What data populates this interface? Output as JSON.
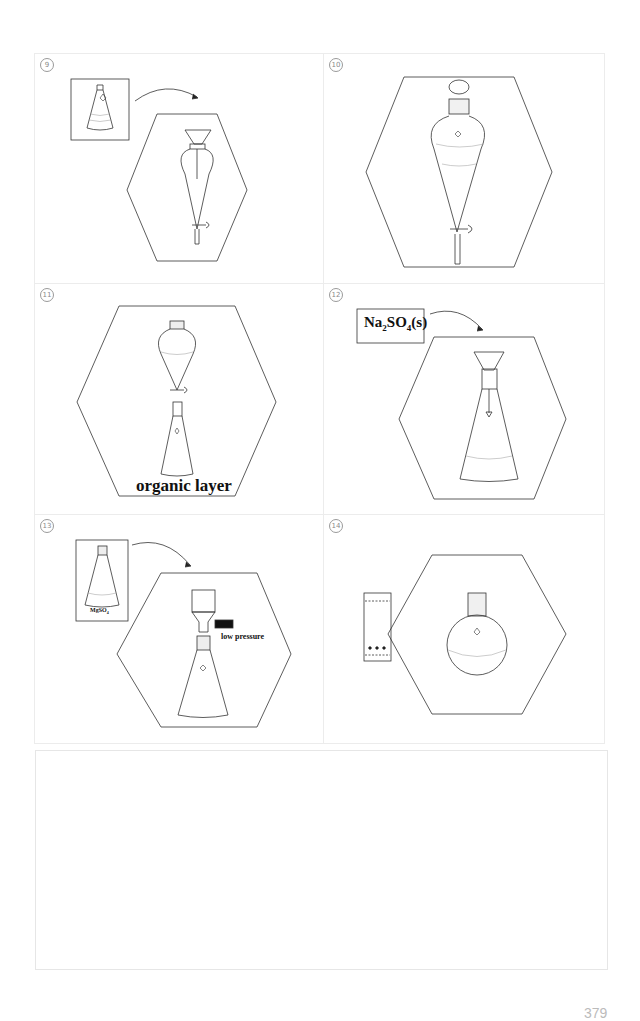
{
  "panels": [
    {
      "step": "9",
      "circled": "⑨",
      "description": "Pour flask contents into separatory funnel through funnel",
      "items": [
        "erlenmeyer-flask",
        "funnel",
        "separatory-funnel"
      ]
    },
    {
      "step": "10",
      "circled": "⑩",
      "description": "Stoppered separatory funnel with two liquid layers",
      "items": [
        "stopper",
        "separatory-funnel"
      ]
    },
    {
      "step": "11",
      "circled": "⑪",
      "description": "Drain bottom layer into erlenmeyer flask",
      "label": "organic layer",
      "items": [
        "separatory-funnel",
        "erlenmeyer-flask"
      ]
    },
    {
      "step": "12",
      "circled": "⑫",
      "description": "Add drying agent through funnel",
      "reagent": {
        "base": "Na",
        "sub1": "2",
        "mid": "SO",
        "sub2": "4",
        "tail": "(s)"
      },
      "items": [
        "funnel",
        "erlenmeyer-flask"
      ]
    },
    {
      "step": "13",
      "circled": "⑬",
      "description": "Vacuum filtration of dried solution",
      "flask_label": {
        "base": "MgSO",
        "sub": "4"
      },
      "pressure_label": "low pressure",
      "items": [
        "erlenmeyer-flask",
        "buchner-funnel",
        "filter-flask"
      ]
    },
    {
      "step": "14",
      "circled": "⑭",
      "description": "TLC plate and round-bottom flask",
      "tlc_spots": 3,
      "items": [
        "tlc-plate",
        "round-bottom-flask"
      ]
    }
  ],
  "page_number": "379"
}
